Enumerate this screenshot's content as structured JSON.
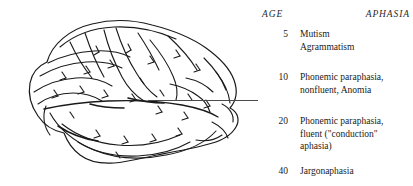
{
  "figure": {
    "illustration": {
      "name": "lateral view of human brain (left hemisphere)",
      "line_color": "#1a1a1a",
      "fill_color": "#ffffff"
    },
    "leader_line": {
      "color": "#4a4a4a",
      "description": "horizontal pointer line from temporal lobe to table"
    }
  },
  "table": {
    "headers": {
      "age": "AGE",
      "aphasia": "APHASIA"
    },
    "rows": [
      {
        "age": "5",
        "lines": [
          "Mutism",
          "Agrammatism"
        ]
      },
      {
        "age": "10",
        "lines": [
          "Phonemic paraphasia,",
          "nonfluent, Anomia"
        ]
      },
      {
        "age": "20",
        "lines": [
          "Phonemic paraphasia,",
          "fluent (\"conduction\"",
          "aphasia)"
        ]
      },
      {
        "age": "40",
        "lines": [
          "Jargonaphasia"
        ]
      }
    ]
  }
}
